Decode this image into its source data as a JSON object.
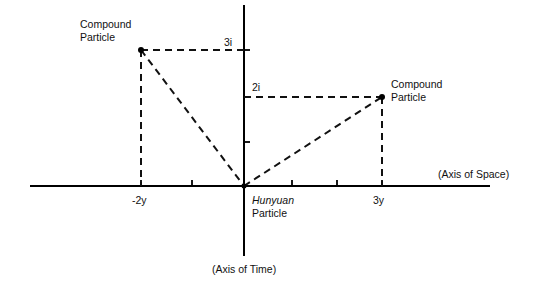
{
  "diagram": {
    "axes": {
      "horizontal_label": "(Axis of Space)",
      "vertical_label": "(Axis of Time)"
    },
    "origin": {
      "label_line1": "Hunyuan",
      "label_line2": "Particle"
    },
    "ticks": {
      "x_neg": "-2y",
      "x_pos": "3y",
      "y_upper": "3i",
      "y_lower": "2i"
    },
    "particles": [
      {
        "name": "left-compound",
        "label_line1": "Compound",
        "label_line2": "Particle",
        "coords": "(-2y, 3i)"
      },
      {
        "name": "right-compound",
        "label_line1": "Compound",
        "label_line2": "Particle",
        "coords": "(3y, 2i)"
      }
    ]
  }
}
